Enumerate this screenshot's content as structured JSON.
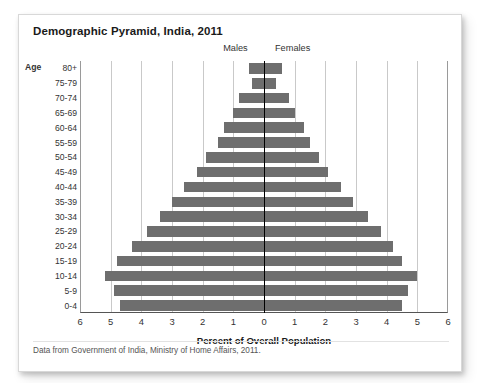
{
  "card": {
    "title": "Demographic Pyramid, India, 2011",
    "footnote": "Data from Government of India, Ministry of Home Affairs, 2011."
  },
  "labels": {
    "age_header": "Age",
    "males": "Males",
    "females": "Females",
    "xaxis_title": "Percent of Overall Population"
  },
  "colors": {
    "bar": "#6e6e6e",
    "center_axis": "#000000",
    "gridline": "#c9c9c9",
    "card_background": "#ffffff"
  },
  "chart_data": {
    "type": "bar",
    "title": "Demographic Pyramid, India, 2011",
    "subtype": "population-pyramid",
    "orientation": "horizontal",
    "xlabel": "Percent of Overall Population",
    "ylabel": "Age",
    "xlim": [
      -6,
      6
    ],
    "xtick_values": [
      -6,
      -5,
      -4,
      -3,
      -2,
      -1,
      0,
      1,
      2,
      3,
      4,
      5,
      6
    ],
    "xtick_labels": [
      "6",
      "5",
      "4",
      "3",
      "2",
      "1",
      "0",
      "1",
      "2",
      "3",
      "4",
      "5",
      "6"
    ],
    "grid": true,
    "legend": [
      "Males",
      "Females"
    ],
    "legend_position": "top",
    "note": "Male values are plotted leftward from the zero axis; female values rightward. Units are percent of overall population.",
    "categories": [
      "80+",
      "75-79",
      "70-74",
      "65-69",
      "60-64",
      "55-59",
      "50-54",
      "45-49",
      "40-44",
      "35-39",
      "30-34",
      "25-29",
      "20-24",
      "15-19",
      "10-14",
      "5-9",
      "0-4"
    ],
    "series": [
      {
        "name": "Males",
        "values": [
          0.5,
          0.4,
          0.8,
          1.0,
          1.3,
          1.5,
          1.9,
          2.2,
          2.6,
          3.0,
          3.4,
          3.8,
          4.3,
          4.8,
          5.2,
          4.9,
          4.7
        ]
      },
      {
        "name": "Females",
        "values": [
          0.6,
          0.4,
          0.8,
          1.0,
          1.3,
          1.5,
          1.8,
          2.1,
          2.5,
          2.9,
          3.4,
          3.8,
          4.2,
          4.5,
          5.0,
          4.7,
          4.5
        ]
      }
    ]
  }
}
